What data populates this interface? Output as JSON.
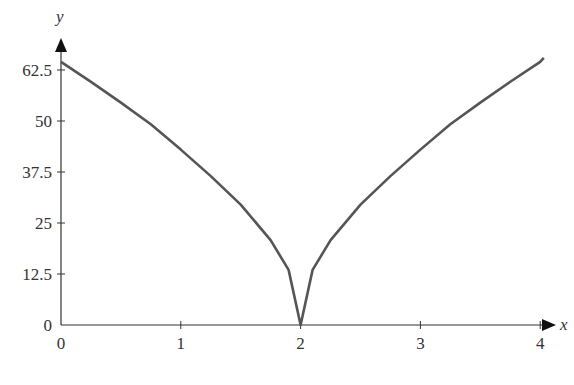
{
  "chart_data": {
    "type": "line",
    "title": "",
    "xlabel": "x",
    "ylabel": "y",
    "xlim": [
      0,
      4.05
    ],
    "ylim": [
      0,
      68
    ],
    "x_ticks": [
      0,
      1,
      2,
      3,
      4
    ],
    "x_tick_labels": [
      "0",
      "1",
      "2",
      "3",
      "4"
    ],
    "y_ticks": [
      0,
      12.5,
      25,
      37.5,
      50,
      62.5
    ],
    "y_tick_labels": [
      "0",
      "12.5",
      "25",
      "37.5",
      "50",
      "62.5"
    ],
    "grid": false,
    "legend": null,
    "series": [
      {
        "name": "y",
        "color": "#555555",
        "x": [
          0,
          0.25,
          0.5,
          0.75,
          1,
          1.25,
          1.5,
          1.75,
          1.9,
          2,
          2.1,
          2.25,
          2.5,
          2.75,
          3,
          3.25,
          3.5,
          3.75,
          4,
          4.03
        ],
        "values": [
          64.5,
          59.6,
          54.5,
          49.2,
          43.0,
          36.5,
          29.5,
          20.8,
          13.5,
          0,
          13.5,
          20.8,
          29.5,
          36.5,
          43.0,
          49.2,
          54.5,
          59.6,
          64.5,
          65.5
        ]
      }
    ]
  },
  "axes": {
    "x_label": "x",
    "y_label": "y",
    "color": "#333333"
  }
}
